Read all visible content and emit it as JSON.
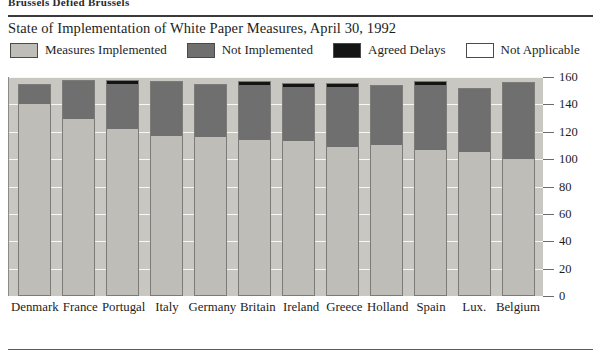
{
  "page": {
    "running_head": "Brussels Defied Brussels",
    "title": "State of Implementation of White Paper Measures, April 30, 1992"
  },
  "legend": {
    "items": [
      {
        "label": "Measures Implemented",
        "color": "#bfbdb8",
        "key": "implemented"
      },
      {
        "label": "Not Implemented",
        "color": "#6f6f6f",
        "key": "not_implemented"
      },
      {
        "label": "Agreed Delays",
        "color": "#141414",
        "key": "agreed_delays"
      },
      {
        "label": "Not Applicable",
        "color": "#ffffff",
        "key": "not_applicable"
      }
    ]
  },
  "chart_data": {
    "type": "bar",
    "subtype": "stacked-column",
    "title": "State of Implementation of White Paper Measures, April 30, 1992",
    "xlabel": "",
    "ylabel": "",
    "ylim": [
      0,
      160
    ],
    "ytick_step": 20,
    "yticks": [
      160,
      140,
      120,
      100,
      80,
      60,
      40,
      20,
      0
    ],
    "grid": true,
    "legend_position": "top",
    "categories": [
      "Denmark",
      "France",
      "Portugal",
      "Italy",
      "Germany",
      "Britain",
      "Ireland",
      "Greece",
      "Holland",
      "Spain",
      "Lux.",
      "Belgium"
    ],
    "series": [
      {
        "name": "Measures Implemented",
        "color": "#bfbdb8",
        "values": [
          140,
          129,
          122,
          117,
          116,
          114,
          113,
          109,
          110,
          107,
          105,
          100
        ]
      },
      {
        "name": "Not Implemented",
        "color": "#6f6f6f",
        "values": [
          15,
          29,
          33,
          40,
          39,
          40,
          40,
          44,
          44,
          47,
          47,
          56
        ]
      },
      {
        "name": "Agreed Delays",
        "color": "#141414",
        "values": [
          0,
          0,
          3,
          0,
          0,
          3,
          3,
          3,
          0,
          3,
          0,
          0
        ]
      }
    ],
    "totals": [
      155,
      158,
      158,
      157,
      155,
      157,
      156,
      156,
      154,
      157,
      152,
      156
    ]
  }
}
